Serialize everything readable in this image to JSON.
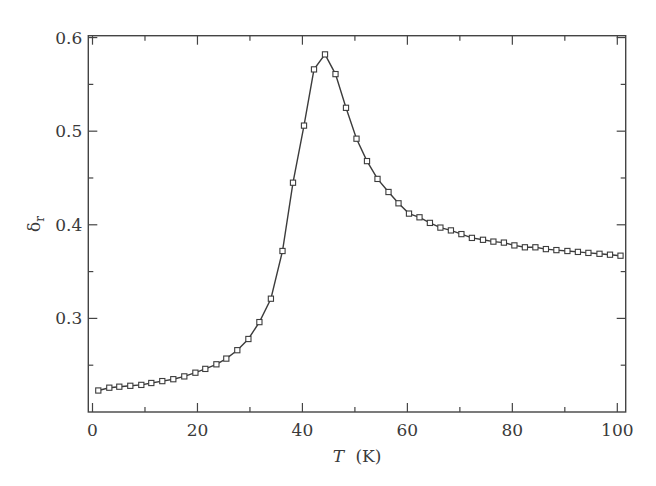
{
  "chart_data": {
    "type": "line",
    "title": "",
    "xlabel": "T",
    "xlabel_unit": "(K)",
    "ylabel": "δ",
    "ylabel_subscript": "r",
    "xlim": [
      -0.8,
      101.6
    ],
    "ylim": [
      0.2,
      0.602
    ],
    "x_major_ticks": [
      0,
      20,
      40,
      60,
      80,
      100
    ],
    "x_minor_ticks": [
      10,
      30,
      50,
      70,
      90
    ],
    "x_tick_labels": [
      "0",
      "20",
      "40",
      "60",
      "80",
      "100"
    ],
    "y_major_ticks": [
      0.3,
      0.4,
      0.5,
      0.6
    ],
    "y_minor_ticks": [
      0.25,
      0.35,
      0.45,
      0.55
    ],
    "y_tick_labels": [
      "0.3",
      "0.4",
      "0.5",
      "0.6"
    ],
    "grid": false,
    "legend": null,
    "marker": "open-square",
    "series": [
      {
        "name": "δr",
        "x": [
          1.1,
          3.2,
          5.1,
          7.2,
          9.3,
          11.2,
          13.3,
          15.4,
          17.5,
          19.6,
          21.5,
          23.6,
          25.5,
          27.6,
          29.7,
          31.8,
          34.0,
          36.2,
          38.2,
          40.3,
          42.2,
          44.3,
          46.3,
          48.3,
          50.3,
          52.3,
          54.3,
          56.4,
          58.3,
          60.3,
          62.3,
          64.3,
          66.3,
          68.3,
          70.3,
          72.3,
          74.4,
          76.4,
          78.4,
          80.4,
          82.4,
          84.4,
          86.4,
          88.4,
          90.5,
          92.5,
          94.5,
          96.6,
          98.6,
          100.6
        ],
        "y": [
          0.223,
          0.226,
          0.227,
          0.228,
          0.229,
          0.231,
          0.233,
          0.235,
          0.238,
          0.242,
          0.246,
          0.251,
          0.257,
          0.266,
          0.278,
          0.296,
          0.321,
          0.372,
          0.445,
          0.506,
          0.566,
          0.582,
          0.561,
          0.525,
          0.492,
          0.468,
          0.449,
          0.435,
          0.423,
          0.412,
          0.408,
          0.402,
          0.397,
          0.394,
          0.39,
          0.386,
          0.384,
          0.382,
          0.381,
          0.378,
          0.376,
          0.376,
          0.374,
          0.373,
          0.372,
          0.371,
          0.37,
          0.369,
          0.368,
          0.367
        ]
      }
    ]
  }
}
